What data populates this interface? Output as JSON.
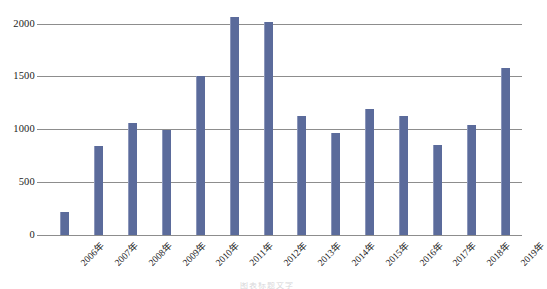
{
  "chart_data": {
    "type": "bar",
    "title": "",
    "subtitle": "",
    "xlabel": "",
    "ylabel": "",
    "categories": [
      "2006年",
      "2007年",
      "2008年",
      "2009年",
      "2010年",
      "2011年",
      "2012年",
      "2013年",
      "2014年",
      "2015年",
      "2016年",
      "2017年",
      "2018年",
      "2019年"
    ],
    "values": [
      218,
      845,
      1065,
      995,
      1505,
      2066,
      2019,
      1128,
      967,
      1196,
      1130,
      855,
      1047,
      1580
    ],
    "series": [
      {
        "name": "",
        "values": [
          218,
          845,
          1065,
          995,
          1505,
          2066,
          2019,
          1128,
          967,
          1196,
          1130,
          855,
          1047,
          1580
        ]
      }
    ],
    "ylim": [
      0,
      2000
    ],
    "yticks": [
      0,
      500,
      1000,
      1500,
      2000
    ],
    "ytick_labels": [
      "0",
      "500",
      "1000",
      "1500",
      "2000"
    ],
    "grid": true,
    "legend": false,
    "legend_position": "none",
    "bar_color": "#5b6b9b",
    "gridline_color": "#8d8d8d",
    "background_color": "#ffffff"
  },
  "footer": {
    "caption": "图表标题文字"
  }
}
